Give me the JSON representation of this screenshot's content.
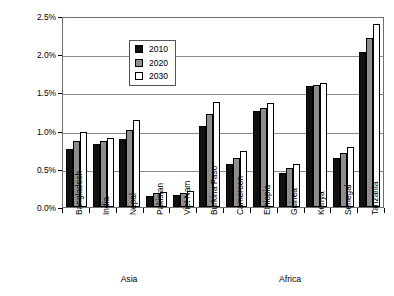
{
  "chart_data": {
    "type": "bar",
    "title": "",
    "xlabel": "",
    "ylabel": "Expenditure as a percentage of GDP",
    "ylim": [
      0,
      2.5
    ],
    "ytick_labels": [
      "0.0%",
      "0.5%",
      "1.0%",
      "1.5%",
      "2.0%",
      "2.5%"
    ],
    "ytick_values": [
      0,
      0.5,
      1.0,
      1.5,
      2.0,
      2.5
    ],
    "grid": true,
    "legend_position": "upper-left-inside",
    "categories": [
      "Bangladesh",
      "India",
      "Nepal",
      "Pakistan",
      "Viet Nam",
      "Burkina Faso",
      "Cameroon",
      "Ethiopia",
      "Guinea",
      "Kenya",
      "Senegal",
      "Tanzania"
    ],
    "series": [
      {
        "name": "2010",
        "color": "#111111",
        "values": [
          0.76,
          0.82,
          0.89,
          0.15,
          0.16,
          1.06,
          0.56,
          1.26,
          0.45,
          1.58,
          0.64,
          2.03
        ]
      },
      {
        "name": "2020",
        "color": "#8d8d8d",
        "values": [
          0.87,
          0.86,
          1.01,
          0.18,
          0.18,
          1.22,
          0.64,
          1.3,
          0.51,
          1.6,
          0.71,
          2.21
        ]
      },
      {
        "name": "2030",
        "color": "#ffffff",
        "values": [
          0.98,
          0.9,
          1.14,
          0.2,
          0.21,
          1.37,
          0.73,
          1.36,
          0.56,
          1.62,
          0.78,
          2.39
        ]
      }
    ],
    "groups": [
      {
        "label": "Asia",
        "categories": [
          "Bangladesh",
          "India",
          "Nepal",
          "Pakistan",
          "Viet Nam"
        ]
      },
      {
        "label": "Africa",
        "categories": [
          "Burkina Faso",
          "Cameroon",
          "Ethiopia",
          "Guinea",
          "Kenya",
          "Senegal",
          "Tanzania"
        ]
      }
    ]
  },
  "legend": {
    "entries": [
      {
        "label": "2010"
      },
      {
        "label": "2020"
      },
      {
        "label": "2030"
      }
    ]
  },
  "axis": {
    "y_title": "Expenditure as a percentage of GDP"
  }
}
